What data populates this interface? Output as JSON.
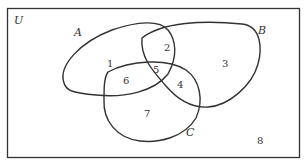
{
  "diagram": {
    "type": "venn",
    "universe_label": "U",
    "sets": [
      {
        "name": "A",
        "label": "A"
      },
      {
        "name": "B",
        "label": "B"
      },
      {
        "name": "C",
        "label": "C"
      }
    ],
    "regions": [
      {
        "id": "1",
        "label": "1",
        "membership": "A only"
      },
      {
        "id": "2",
        "label": "2",
        "membership": "A and B only"
      },
      {
        "id": "3",
        "label": "3",
        "membership": "B only"
      },
      {
        "id": "4",
        "label": "4",
        "membership": "B and C only"
      },
      {
        "id": "5",
        "label": "5",
        "membership": "A and B and C"
      },
      {
        "id": "6",
        "label": "6",
        "membership": "A and C only"
      },
      {
        "id": "7",
        "label": "7",
        "membership": "C only"
      },
      {
        "id": "8",
        "label": "8",
        "membership": "outside A, B, C"
      }
    ],
    "colors": {
      "stroke": "#333333",
      "text": "#333333",
      "background": "#ffffff"
    }
  }
}
